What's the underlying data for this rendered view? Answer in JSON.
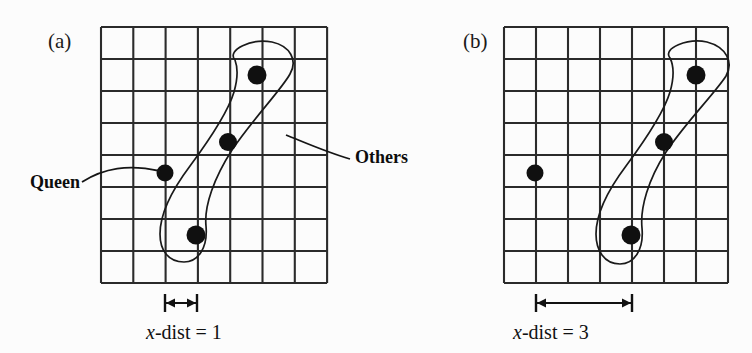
{
  "figure": {
    "background_color": "#fcfcfc",
    "ink_color": "#1a1a1a",
    "dot_color": "#101010"
  },
  "panels": [
    {
      "tag": "(a)",
      "tag_x": 48,
      "tag_y": 48,
      "grid": {
        "x": 101,
        "y": 27,
        "cols": 7,
        "rows": 8,
        "cell_w": 32.3,
        "cell_h": 32.0
      },
      "queen": {
        "label": "Queen",
        "cx": 165,
        "cy": 173,
        "r": 8.5
      },
      "others": [
        {
          "cx": 257,
          "cy": 75,
          "r": 9.5
        },
        {
          "cx": 228,
          "cy": 142,
          "r": 9.0
        },
        {
          "cx": 196,
          "cy": 235,
          "r": 9.5
        }
      ],
      "queen_label": {
        "text": "Queen",
        "x": 30,
        "y": 188
      },
      "queen_leader": "M 82 182 C 104 168, 128 164, 160 171",
      "blob": "M 235 60 C 226 50, 252 38, 272 42 C 290 46, 298 60, 290 74 C 282 89, 252 120, 232 150 C 214 178, 204 206, 206 226 C 208 248, 198 262, 184 262 C 168 262, 160 250, 160 234 C 160 214, 172 190, 190 166 C 210 139, 228 112, 234 92 C 238 78, 238 68, 235 60 Z",
      "measure": {
        "label_prefix": "x",
        "label_suffix": "-dist = 1",
        "label_x": 146,
        "label_y": 339,
        "bar_y": 303,
        "x1": 165,
        "x2": 197,
        "cap_top": 294,
        "cap_bottom": 312
      }
    },
    {
      "tag": "(b)",
      "tag_x": 463,
      "tag_y": 48,
      "grid": {
        "x": 504,
        "y": 27,
        "cols": 7,
        "rows": 8,
        "cell_w": 32.0,
        "cell_h": 32.0
      },
      "queen": {
        "label": "Queen",
        "cx": 535,
        "cy": 173,
        "r": 8.5
      },
      "others": [
        {
          "cx": 696,
          "cy": 75,
          "r": 9.5
        },
        {
          "cx": 664,
          "cy": 142,
          "r": 9.0
        },
        {
          "cx": 631,
          "cy": 235,
          "r": 9.5
        }
      ],
      "blob": "M 670 58 C 662 48, 688 38, 707 42 C 726 47, 734 62, 726 76 C 716 92, 686 122, 666 152 C 648 180, 640 208, 642 228 C 644 250, 634 264, 620 264 C 604 264, 596 250, 596 234 C 596 214, 608 190, 626 166 C 646 139, 664 112, 670 92 C 674 78, 674 66, 670 58 Z",
      "measure": {
        "label_prefix": "x",
        "label_suffix": "-dist = 3",
        "label_x": 513,
        "label_y": 339,
        "bar_y": 303,
        "x1": 536,
        "x2": 632,
        "cap_top": 294,
        "cap_bottom": 312
      }
    }
  ],
  "annotations": {
    "others_label": {
      "text": "Others",
      "x": 355,
      "y": 163
    },
    "others_leader": "M 286 135 C 306 143, 326 152, 350 159"
  }
}
